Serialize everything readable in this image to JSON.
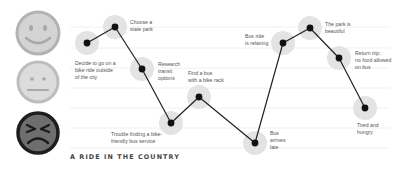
{
  "title": "A RIDE IN THE COUNTRY",
  "colors": {
    "grid": "#ececec",
    "halo": "#e3e3e3",
    "point": "#111111",
    "line": "#222222",
    "happy_fill": "#d4d4d4",
    "happy_ring": "#b3b3b3",
    "neutral_fill": "#dcdcdc",
    "neutral_ring": "#bdbdbd",
    "angry_fill": "#6e6e6e",
    "angry_ring": "#1e1e1e",
    "label_text": "#555555",
    "title_text": "#444444"
  },
  "faces": [
    {
      "mood": "happy",
      "icon": "happy-face-icon"
    },
    {
      "mood": "neutral",
      "icon": "neutral-face-icon"
    },
    {
      "mood": "angry",
      "icon": "angry-face-icon"
    }
  ],
  "steps": [
    {
      "label": "Decide to go on a\nbike ride outside\nof the city",
      "mood_level": "happy"
    },
    {
      "label": "Choose a\nstate park",
      "mood_level": "happy"
    },
    {
      "label": "Research\ntransit\noptions",
      "mood_level": "neutral"
    },
    {
      "label": "Trouble finding a bike-\nfriendly bus service",
      "mood_level": "angry"
    },
    {
      "label": "Find a bus\nwith a bike rack",
      "mood_level": "neutral"
    },
    {
      "label": "Bus\narrives\nlate",
      "mood_level": "angry"
    },
    {
      "label": "Bus ride\nis relaxing",
      "mood_level": "happy"
    },
    {
      "label": "The park is\nbeautiful",
      "mood_level": "happy"
    },
    {
      "label": "Return trip;\nno food allowed\non bus",
      "mood_level": "happy"
    },
    {
      "label": "Tired and\nhungry",
      "mood_level": "neutral"
    }
  ]
}
